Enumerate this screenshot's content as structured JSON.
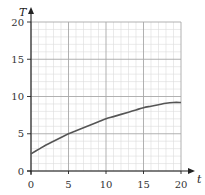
{
  "chart_data": {
    "type": "line",
    "title": "",
    "xlabel": "t",
    "ylabel": "T",
    "xlim": [
      0,
      20
    ],
    "ylim": [
      0,
      20
    ],
    "x_ticks": [
      0,
      5,
      10,
      15,
      20
    ],
    "y_ticks": [
      0,
      5,
      10,
      15,
      20
    ],
    "x_tick_labels": [
      "0",
      "5",
      "10",
      "15",
      "20"
    ],
    "y_tick_labels": [
      "0",
      "5",
      "10",
      "15",
      "20"
    ],
    "grid": {
      "major_step": 5,
      "minor_step": 1,
      "on": true
    },
    "legend": null,
    "series": [
      {
        "name": "T(t)",
        "x": [
          0,
          1,
          2,
          3,
          4,
          5,
          6,
          7,
          8,
          9,
          10,
          11,
          12,
          13,
          14,
          15,
          16,
          17,
          18,
          19,
          20
        ],
        "values": [
          2.3,
          2.9,
          3.5,
          4.0,
          4.5,
          5.0,
          5.4,
          5.8,
          6.2,
          6.6,
          7.0,
          7.3,
          7.6,
          7.9,
          8.2,
          8.5,
          8.7,
          8.9,
          9.1,
          9.2,
          9.2
        ]
      }
    ]
  },
  "colors": {
    "curve": "#555555",
    "axis": "#222222",
    "major_grid": "#a8a8a8",
    "minor_grid": "#dcdcdc"
  }
}
